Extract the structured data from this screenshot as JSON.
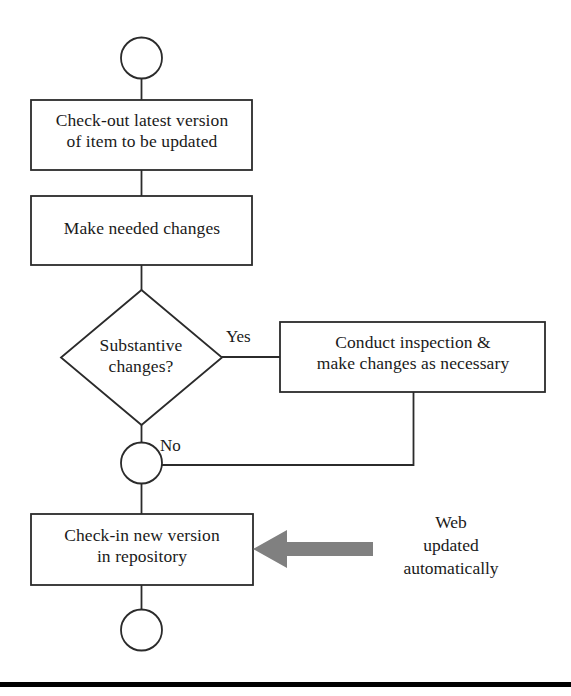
{
  "diagram": {
    "colors": {
      "stroke": "#2b2b2b",
      "fill": "#ffffff",
      "text": "#1a1a1a",
      "gray_arrow": "#808080",
      "rule": "#000000"
    },
    "nodes": {
      "start": {
        "type": "start-circle",
        "label": ""
      },
      "checkout": {
        "type": "process-box",
        "label": "Check-out latest version\nof item to be updated"
      },
      "make_changes": {
        "type": "process-box",
        "label": "Make needed changes"
      },
      "decision": {
        "type": "decision-diamond",
        "label": "Substantive\nchanges?"
      },
      "conduct": {
        "type": "process-box",
        "label": "Conduct inspection &\nmake changes as necessary"
      },
      "merge": {
        "type": "merge-circle",
        "label": ""
      },
      "checkin": {
        "type": "process-box",
        "label": "Check-in new version\nin repository"
      },
      "end": {
        "type": "end-circle",
        "label": ""
      }
    },
    "edge_labels": {
      "yes": "Yes",
      "no": "No"
    },
    "annotations": {
      "web_note": "Web\nupdated\nautomatically"
    }
  }
}
